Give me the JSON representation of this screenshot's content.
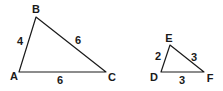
{
  "diagram": {
    "triangles": [
      {
        "name": "ABC",
        "vertices": {
          "A": {
            "label": "A",
            "x": 19,
            "y": 72,
            "lx": 14,
            "ly": 80
          },
          "B": {
            "label": "B",
            "x": 36,
            "y": 17,
            "lx": 36,
            "ly": 13
          },
          "C": {
            "label": "C",
            "x": 106,
            "y": 72,
            "lx": 112,
            "ly": 81
          }
        },
        "sides": {
          "AB": {
            "value": "4",
            "lx": 20,
            "ly": 45
          },
          "BC": {
            "value": "6",
            "lx": 78,
            "ly": 44
          },
          "AC": {
            "value": "6",
            "lx": 60,
            "ly": 84
          }
        }
      },
      {
        "name": "DEF",
        "vertices": {
          "D": {
            "label": "D",
            "x": 161,
            "y": 72,
            "lx": 154,
            "ly": 81
          },
          "E": {
            "label": "E",
            "x": 170,
            "y": 45,
            "lx": 169,
            "ly": 42
          },
          "F": {
            "label": "F",
            "x": 204,
            "y": 72,
            "lx": 210,
            "ly": 82
          }
        },
        "sides": {
          "DE": {
            "value": "2",
            "lx": 158,
            "ly": 60
          },
          "EF": {
            "value": "3",
            "lx": 194,
            "ly": 61
          },
          "DF": {
            "value": "3",
            "lx": 182,
            "ly": 84
          }
        }
      }
    ]
  }
}
